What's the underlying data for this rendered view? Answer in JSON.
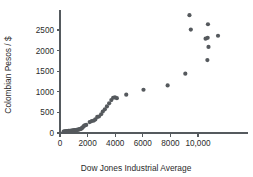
{
  "chart_data": {
    "type": "scatter",
    "title": "",
    "subtitle": "",
    "xlabel": "Dow Jones Industrial Average",
    "ylabel": "Colombian Pesos / $",
    "xlim": [
      0,
      12000
    ],
    "ylim": [
      0,
      2950
    ],
    "grid": false,
    "legend": null,
    "xticks": [
      0,
      2000,
      4000,
      6000,
      8000,
      10000
    ],
    "xtick_labels": [
      "0",
      "2000",
      "4000",
      "6000",
      "8000",
      "10,000"
    ],
    "yticks": [
      0,
      500,
      1000,
      1500,
      2000,
      2500
    ],
    "ytick_labels": [
      "0",
      "500",
      "1000",
      "1500",
      "2000",
      "2500"
    ],
    "marker": {
      "shape": "circle",
      "color": "#55595d",
      "radius_px": 2.1
    },
    "series": [
      {
        "name": "Exchange rate vs DJIA",
        "color": "#55595d",
        "points": [
          [
            260,
            35
          ],
          [
            330,
            40
          ],
          [
            400,
            42
          ],
          [
            470,
            45
          ],
          [
            540,
            48
          ],
          [
            610,
            50
          ],
          [
            680,
            52
          ],
          [
            760,
            55
          ],
          [
            830,
            58
          ],
          [
            900,
            60
          ],
          [
            960,
            62
          ],
          [
            1020,
            65
          ],
          [
            1080,
            68
          ],
          [
            1140,
            70
          ],
          [
            1200,
            74
          ],
          [
            1260,
            78
          ],
          [
            1320,
            82
          ],
          [
            1380,
            86
          ],
          [
            1440,
            92
          ],
          [
            1500,
            100
          ],
          [
            1560,
            112
          ],
          [
            1620,
            128
          ],
          [
            1680,
            150
          ],
          [
            1740,
            172
          ],
          [
            1800,
            186
          ],
          [
            1900,
            196
          ],
          [
            2150,
            265
          ],
          [
            2300,
            290
          ],
          [
            2450,
            302
          ],
          [
            2560,
            330
          ],
          [
            2700,
            390
          ],
          [
            2820,
            400
          ],
          [
            2980,
            455
          ],
          [
            3100,
            520
          ],
          [
            3250,
            575
          ],
          [
            3400,
            645
          ],
          [
            3560,
            720
          ],
          [
            3720,
            800
          ],
          [
            3850,
            855
          ],
          [
            3980,
            865
          ],
          [
            4120,
            845
          ],
          [
            4800,
            930
          ],
          [
            6050,
            1050
          ],
          [
            7800,
            1155
          ],
          [
            9080,
            1440
          ],
          [
            9380,
            2860
          ],
          [
            9480,
            2510
          ],
          [
            10550,
            2290
          ],
          [
            10700,
            2310
          ],
          [
            10720,
            2640
          ],
          [
            10760,
            2090
          ],
          [
            10680,
            1770
          ],
          [
            11450,
            2360
          ]
        ]
      }
    ]
  }
}
